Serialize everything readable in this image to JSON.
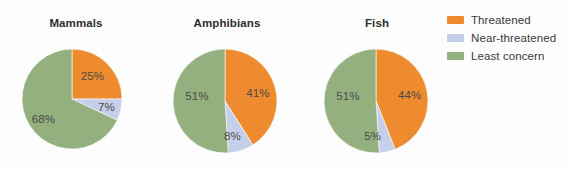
{
  "chart_data": {
    "type": "pie",
    "title": "",
    "subtitle": "",
    "xlabel": "",
    "ylabel": "",
    "grid": false,
    "legend_position": "right",
    "categories": [
      "Threatened",
      "Near-threatened",
      "Least concern"
    ],
    "colors": {
      "threatened": "#ee8b2e",
      "near_threatened": "#c6cfe9",
      "least_concern": "#93b07e",
      "background": "#fdfdfd",
      "label_text": "#4a4a4a",
      "title_text": "#2d2d2d"
    },
    "panels": [
      {
        "title": "Mammals",
        "slices": [
          {
            "name": "Threatened",
            "value": 25,
            "label": "25%"
          },
          {
            "name": "Near-threatened",
            "value": 7,
            "label": "7%"
          },
          {
            "name": "Least concern",
            "value": 68,
            "label": "68%"
          }
        ]
      },
      {
        "title": "Amphibians",
        "slices": [
          {
            "name": "Threatened",
            "value": 41,
            "label": "41%"
          },
          {
            "name": "Near-threatened",
            "value": 8,
            "label": "8%"
          },
          {
            "name": "Least concern",
            "value": 51,
            "label": "51%"
          }
        ]
      },
      {
        "title": "Fish",
        "slices": [
          {
            "name": "Threatened",
            "value": 44,
            "label": "44%"
          },
          {
            "name": "Near-threatened",
            "value": 5,
            "label": "5%"
          },
          {
            "name": "Least concern",
            "value": 51,
            "label": "51%"
          }
        ]
      }
    ],
    "legend": [
      {
        "label": "Threatened",
        "color": "#ee8b2e"
      },
      {
        "label": "Near-threatened",
        "color": "#c6cfe9"
      },
      {
        "label": "Least concern",
        "color": "#93b07e"
      }
    ]
  },
  "layout": {
    "panels": [
      {
        "cx": 72,
        "cy": 99,
        "r": 50,
        "left": 0,
        "width": 152,
        "label_r": 0.58
      },
      {
        "cx": 225,
        "cy": 101,
        "r": 52,
        "left": 152,
        "width": 150,
        "label_r": 0.58
      },
      {
        "cx": 376,
        "cy": 101,
        "r": 52,
        "left": 302,
        "width": 150,
        "label_r": 0.58
      }
    ],
    "label_offsets": [
      [
        {
          "dx": 0,
          "dy": -2
        },
        {
          "dx": 6,
          "dy": 2
        },
        {
          "dx": -4,
          "dy": 4
        }
      ],
      [
        {
          "dx": 4,
          "dy": 0
        },
        {
          "dx": -2,
          "dy": 6
        },
        {
          "dx": 2,
          "dy": -6
        }
      ],
      [
        {
          "dx": 4,
          "dy": 0
        },
        {
          "dx": -10,
          "dy": 6
        },
        {
          "dx": 2,
          "dy": -6
        }
      ]
    ]
  }
}
